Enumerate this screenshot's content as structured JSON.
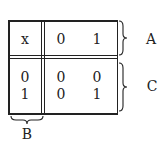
{
  "diagram": {
    "corner_cell": "x",
    "header_values": [
      "0",
      "1"
    ],
    "row_labels": [
      "0",
      "1"
    ],
    "body": [
      [
        "0",
        "0"
      ],
      [
        "0",
        "1"
      ]
    ],
    "braces": {
      "header": {
        "label": "A"
      },
      "body": {
        "label": "C"
      },
      "row_labels": {
        "label": "B"
      }
    }
  }
}
